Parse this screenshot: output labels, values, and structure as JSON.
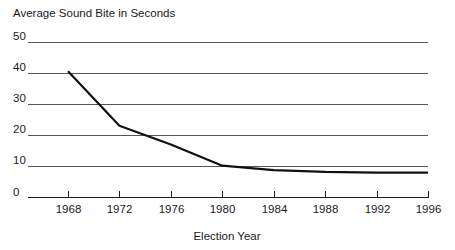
{
  "chart_data": {
    "type": "line",
    "title": "Average Sound Bite in Seconds",
    "xlabel": "Election Year",
    "ylabel": "",
    "categories": [
      1968,
      1972,
      1976,
      1980,
      1984,
      1988,
      1992,
      1996
    ],
    "x": [
      1968,
      1972,
      1976,
      1980,
      1984,
      1988,
      1992,
      1996
    ],
    "values": [
      40.5,
      23.0,
      17.0,
      10.2,
      8.8,
      8.2,
      8.0,
      8.0
    ],
    "series": [
      {
        "name": "Average Sound Bite",
        "values": [
          40.5,
          23.0,
          17.0,
          10.2,
          8.8,
          8.2,
          8.0,
          8.0
        ]
      }
    ],
    "xlim": [
      1966,
      1998
    ],
    "ylim": [
      0,
      50
    ],
    "yticks": [
      0,
      10,
      20,
      30,
      40,
      50
    ],
    "ytick_labels": [
      "0",
      "10",
      "20",
      "30",
      "40",
      "50"
    ],
    "xticks": [
      1968,
      1972,
      1976,
      1980,
      1984,
      1988,
      1992,
      1996
    ],
    "xtick_labels": [
      "1968",
      "1972",
      "1976",
      "1980",
      "1984",
      "1988",
      "1992",
      "1996"
    ],
    "grid": "horizontal",
    "legend": "none",
    "line_color": "#111111",
    "grid_color": "#555555",
    "axis_color": "#1a1a1a"
  }
}
